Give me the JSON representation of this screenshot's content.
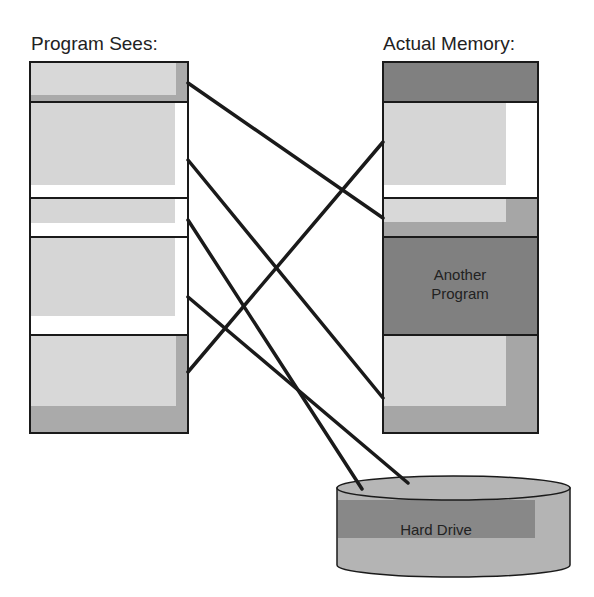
{
  "titles": {
    "left": "Program Sees:",
    "right": "Actual Memory:"
  },
  "colors": {
    "outline": "#1a1a1a",
    "light": "#d6d6d6",
    "mid": "#aaaaaa",
    "dark": "#7f7f7f",
    "white": "#ffffff",
    "drive_body": "#b4b4b4",
    "drive_band": "#888888"
  },
  "program_sees": {
    "blocks": [
      {
        "y": 62,
        "h": 40,
        "style": "gray-shadow"
      },
      {
        "y": 102,
        "h": 96,
        "style": "light-white"
      },
      {
        "y": 198,
        "h": 39,
        "style": "light-white"
      },
      {
        "y": 237,
        "h": 98,
        "style": "light-white"
      },
      {
        "y": 335,
        "h": 98,
        "style": "gray-shadow"
      }
    ]
  },
  "actual_memory": {
    "blocks": [
      {
        "y": 62,
        "h": 40,
        "style": "dark"
      },
      {
        "y": 102,
        "h": 96,
        "style": "light-white"
      },
      {
        "y": 198,
        "h": 39,
        "style": "light-gray"
      },
      {
        "y": 237,
        "h": 98,
        "style": "dark",
        "label_line1": "Another",
        "label_line2": "Program"
      },
      {
        "y": 335,
        "h": 98,
        "style": "light-gray"
      }
    ]
  },
  "hard_drive": {
    "label": "Hard Drive"
  },
  "mappings": [
    {
      "from": [
        188,
        83
      ],
      "to": [
        383,
        218
      ]
    },
    {
      "from": [
        188,
        160
      ],
      "to": [
        383,
        398
      ]
    },
    {
      "from": [
        188,
        220
      ],
      "to": [
        362,
        489
      ]
    },
    {
      "from": [
        188,
        297
      ],
      "to": [
        408,
        483
      ]
    },
    {
      "from": [
        188,
        372
      ],
      "to": [
        383,
        142
      ]
    }
  ]
}
